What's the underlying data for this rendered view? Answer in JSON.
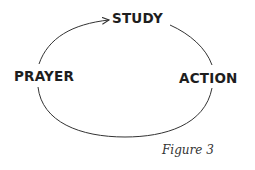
{
  "diagram": {
    "type": "cycle",
    "nodes": [
      {
        "id": "study",
        "label": "STUDY"
      },
      {
        "id": "action",
        "label": "ACTION"
      },
      {
        "id": "prayer",
        "label": "PRAYER"
      }
    ],
    "edges": [
      {
        "from": "prayer",
        "to": "study",
        "arrow": true
      },
      {
        "from": "study",
        "to": "action",
        "arrow": false
      },
      {
        "from": "action",
        "to": "prayer",
        "arrow": false
      }
    ],
    "caption": "Figure 3",
    "colors": {
      "line": "#333333",
      "text": "#1e1e1e",
      "background": "#ffffff"
    }
  }
}
